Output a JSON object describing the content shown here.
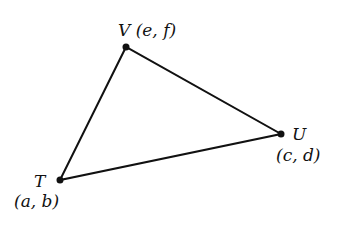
{
  "diagram": {
    "type": "triangle",
    "vertices": [
      {
        "name": "T",
        "coords": "(a, b)",
        "x": 60,
        "y": 180
      },
      {
        "name": "V",
        "coords": "(e, f)",
        "x": 126,
        "y": 47
      },
      {
        "name": "U",
        "coords": "(c, d)",
        "x": 281,
        "y": 134
      }
    ],
    "edges": [
      [
        "T",
        "V"
      ],
      [
        "V",
        "U"
      ],
      [
        "U",
        "T"
      ]
    ],
    "labels": {
      "V": "V (e, f)",
      "U_name": "U",
      "U_coords": "(c, d)",
      "T_name": "T",
      "T_coords": "(a, b)"
    },
    "colors": {
      "stroke": "#111111",
      "background": "#ffffff"
    }
  }
}
